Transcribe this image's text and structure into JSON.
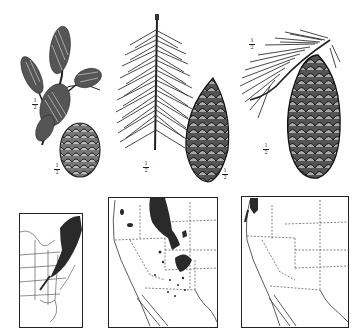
{
  "plate": {
    "specimens": [
      {
        "id": "left",
        "branchlet_scale": "1/2",
        "cone_scale": "1/2"
      },
      {
        "id": "middle",
        "branchlet_scale": "1/2",
        "cone_scale": "1/2"
      },
      {
        "id": "right",
        "branchlet_scale": "1/2",
        "cone_scale": "1/2"
      }
    ],
    "maps": [
      {
        "id": "eastern-us",
        "region": "Eastern United States",
        "range_shaded": true
      },
      {
        "id": "western-us-1",
        "region": "Western United States",
        "range_shaded": true
      },
      {
        "id": "western-us-2",
        "region": "Western United States (Pacific coast)",
        "range_shaded": true
      }
    ]
  },
  "labels": {
    "frac_num": "1",
    "frac_den": "2"
  },
  "colors": {
    "ink": "#222222",
    "range_fill": "#2a2a2a",
    "paper": "#ffffff"
  }
}
